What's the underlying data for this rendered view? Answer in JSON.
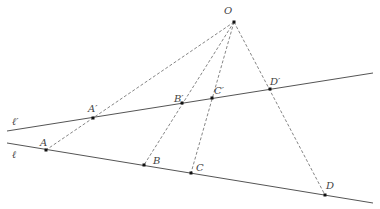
{
  "diagram": {
    "colors": {
      "line": "#555555",
      "dash": "#777777",
      "point": "#111111",
      "label": "#444444"
    },
    "center": {
      "name": "O",
      "label": "O",
      "x": 234,
      "y": 22,
      "lx": 224,
      "ly": 14
    },
    "lines": [
      {
        "name": "l-prime",
        "label": "ℓ′",
        "x1": 7,
        "y1": 131,
        "x2": 373,
        "y2": 73,
        "lx": 12,
        "ly": 125
      },
      {
        "name": "l",
        "label": "ℓ",
        "x1": 7,
        "y1": 143,
        "x2": 373,
        "y2": 203,
        "lx": 12,
        "ly": 158
      }
    ],
    "points": [
      {
        "name": "A-prime",
        "label": "A′",
        "x": 93,
        "y": 118,
        "lx": 88,
        "ly": 112
      },
      {
        "name": "B-prime",
        "label": "B′",
        "x": 182,
        "y": 103,
        "lx": 174,
        "ly": 102
      },
      {
        "name": "C-prime",
        "label": "C′",
        "x": 212,
        "y": 98,
        "lx": 214,
        "ly": 94
      },
      {
        "name": "D-prime",
        "label": "D′",
        "x": 270,
        "y": 89,
        "lx": 270,
        "ly": 85
      },
      {
        "name": "A",
        "label": "A",
        "x": 46,
        "y": 150,
        "lx": 40,
        "ly": 146
      },
      {
        "name": "B",
        "label": "B",
        "x": 144,
        "y": 165,
        "lx": 153,
        "ly": 164
      },
      {
        "name": "C",
        "label": "C",
        "x": 191,
        "y": 173,
        "lx": 196,
        "ly": 171
      },
      {
        "name": "D",
        "label": "D",
        "x": 325,
        "y": 195,
        "lx": 326,
        "ly": 189
      }
    ],
    "rays": [
      {
        "name": "ray-O-A",
        "to": "A"
      },
      {
        "name": "ray-O-B",
        "to": "B"
      },
      {
        "name": "ray-O-C",
        "to": "C"
      },
      {
        "name": "ray-O-D",
        "to": "D"
      }
    ]
  }
}
